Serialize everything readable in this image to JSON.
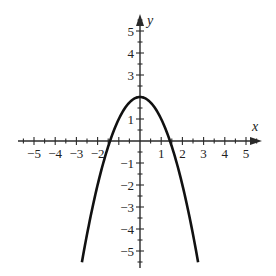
{
  "chart_data": {
    "type": "line",
    "title": "",
    "xlabel": "x",
    "ylabel": "y",
    "xlim": [
      -5.5,
      5.5
    ],
    "ylim": [
      -5.5,
      5.5
    ],
    "grid": false,
    "x_ticks": [
      -5,
      -4,
      -3,
      -2,
      -1,
      1,
      2,
      3,
      4,
      5
    ],
    "x_tick_labels": [
      "−5",
      "−4",
      "−3",
      "−2",
      "1",
      "2",
      "3",
      "4",
      "5"
    ],
    "y_tick_labels": [
      "5",
      "4",
      "3",
      "1",
      "−1",
      "−2",
      "−3",
      "−4",
      "−5"
    ],
    "minor_tick_step": 0.5,
    "series": [
      {
        "name": "y = 2 - x^2",
        "equation": "y = 2 - x^2",
        "x": [
          -2.74,
          -2.5,
          -2,
          -1.5,
          -1.414,
          -1,
          -0.5,
          0,
          0.5,
          1,
          1.414,
          1.5,
          2,
          2.5,
          2.74
        ],
        "y": [
          -5.5,
          -4.25,
          -2,
          -0.25,
          0,
          1,
          1.75,
          2,
          1.75,
          1,
          0,
          -0.25,
          -2,
          -4.25,
          -5.5
        ]
      }
    ],
    "annotations": {
      "vertex": [
        0,
        2
      ],
      "x_intercepts": [
        -1.414,
        1.414
      ]
    }
  },
  "labels": {
    "x_axis": "x",
    "y_axis": "y",
    "x_ticks": [
      {
        "v": -5,
        "t": "−5"
      },
      {
        "v": -4,
        "t": "−4"
      },
      {
        "v": -3,
        "t": "−3"
      },
      {
        "v": -2,
        "t": "−2"
      },
      {
        "v": 1,
        "t": "1"
      },
      {
        "v": 2,
        "t": "2"
      },
      {
        "v": 3,
        "t": "3"
      },
      {
        "v": 4,
        "t": "4"
      },
      {
        "v": 5,
        "t": "5"
      }
    ],
    "y_ticks": [
      {
        "v": 5,
        "t": "5"
      },
      {
        "v": 4,
        "t": "4"
      },
      {
        "v": 3,
        "t": "3"
      },
      {
        "v": 1,
        "t": "1"
      },
      {
        "v": -1,
        "t": "−1"
      },
      {
        "v": -2,
        "t": "−2"
      },
      {
        "v": -3,
        "t": "−3"
      },
      {
        "v": -4,
        "t": "−4"
      },
      {
        "v": -5,
        "t": "−5"
      }
    ]
  },
  "colors": {
    "axis": "#2a2a2a",
    "curve": "#111111",
    "background": "#ffffff"
  }
}
